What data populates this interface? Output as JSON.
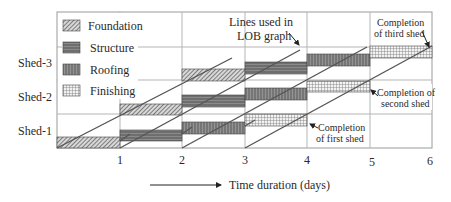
{
  "diagram": {
    "x_axis": {
      "ticks": [
        "1",
        "2",
        "3",
        "4",
        "5",
        "6"
      ],
      "label": "Time duration (days)"
    },
    "y_axis": {
      "rows": [
        "Shed-3",
        "Shed-2",
        "Shed-1"
      ]
    },
    "legend": [
      {
        "name": "Foundation",
        "pattern": "diagonal-hatch"
      },
      {
        "name": "Structure",
        "pattern": "dark-horizontal"
      },
      {
        "name": "Roofing",
        "pattern": "dark-vertical"
      },
      {
        "name": "Finishing",
        "pattern": "crosshatch"
      }
    ],
    "annotations": {
      "lob_lines_line1": "Lines used in",
      "lob_lines_line2": "LOB graph",
      "third_line1": "Completion",
      "third_line2": "of third shed",
      "second_line1": "Completion of",
      "second_line2": "second shed",
      "first_line1": "Completion",
      "first_line2": "of first shed"
    },
    "activities": [
      {
        "shed": "Shed-1",
        "task": "Foundation",
        "start": 0,
        "end": 1
      },
      {
        "shed": "Shed-1",
        "task": "Structure",
        "start": 1,
        "end": 2
      },
      {
        "shed": "Shed-1",
        "task": "Roofing",
        "start": 2,
        "end": 3
      },
      {
        "shed": "Shed-1",
        "task": "Finishing",
        "start": 3,
        "end": 4
      },
      {
        "shed": "Shed-2",
        "task": "Foundation",
        "start": 1,
        "end": 2
      },
      {
        "shed": "Shed-2",
        "task": "Structure",
        "start": 2,
        "end": 3
      },
      {
        "shed": "Shed-2",
        "task": "Roofing",
        "start": 3,
        "end": 4
      },
      {
        "shed": "Shed-2",
        "task": "Finishing",
        "start": 4,
        "end": 5
      },
      {
        "shed": "Shed-3",
        "task": "Foundation",
        "start": 2,
        "end": 3
      },
      {
        "shed": "Shed-3",
        "task": "Structure",
        "start": 3,
        "end": 4
      },
      {
        "shed": "Shed-3",
        "task": "Roofing",
        "start": 4,
        "end": 5
      },
      {
        "shed": "Shed-3",
        "task": "Finishing",
        "start": 5,
        "end": 6
      }
    ]
  }
}
